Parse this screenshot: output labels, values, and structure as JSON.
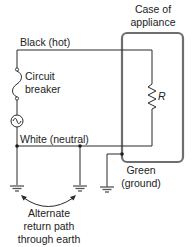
{
  "diagram": {
    "labels": {
      "case_line1": "Case of",
      "case_line2": "appliance",
      "black_wire": "Black (hot)",
      "breaker_line1": "Circuit",
      "breaker_line2": "breaker",
      "resistor": "R",
      "white_wire": "White (neutral)",
      "green_line1": "Green",
      "green_line2": "(ground)",
      "alt_line1": "Alternate",
      "alt_line2": "return path",
      "alt_line3": "through earth"
    },
    "components": [
      {
        "id": "ac-source",
        "type": "ac-voltage-source"
      },
      {
        "id": "circuit-breaker",
        "type": "breaker"
      },
      {
        "id": "load-resistor",
        "type": "resistor",
        "label": "R"
      },
      {
        "id": "appliance-case",
        "type": "enclosure"
      },
      {
        "id": "ground-1",
        "type": "earth-ground"
      },
      {
        "id": "ground-2",
        "type": "earth-ground"
      },
      {
        "id": "ground-3",
        "type": "earth-ground"
      }
    ],
    "colors": {
      "wire": "#2a2a2a",
      "case": "#6e6e6e",
      "text": "#222222"
    }
  }
}
